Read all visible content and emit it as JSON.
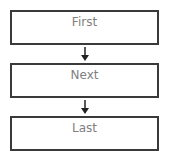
{
  "diagram": {
    "type": "flowchart",
    "direction": "top-to-bottom",
    "nodes": [
      {
        "id": "first",
        "label": "First"
      },
      {
        "id": "next",
        "label": "Next"
      },
      {
        "id": "last",
        "label": "Last"
      }
    ],
    "edges": [
      {
        "from": "first",
        "to": "next"
      },
      {
        "from": "next",
        "to": "last"
      }
    ],
    "colors": {
      "border": "#3a3a3a",
      "text": "#808080",
      "arrow": "#222222",
      "background": "#ffffff"
    }
  }
}
